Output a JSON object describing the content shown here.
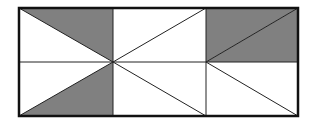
{
  "diagram": {
    "colors": {
      "shade": "#808080",
      "stroke": "#222222",
      "background": "#ffffff"
    },
    "grid": {
      "columns": 3,
      "rows": 2
    },
    "shaded_triangles": [
      "top-left cell: upper-right triangle",
      "bottom-left cell: lower-right triangle",
      "top-right cell: lower-right triangle",
      "top-right cell shade below diagonal"
    ]
  }
}
